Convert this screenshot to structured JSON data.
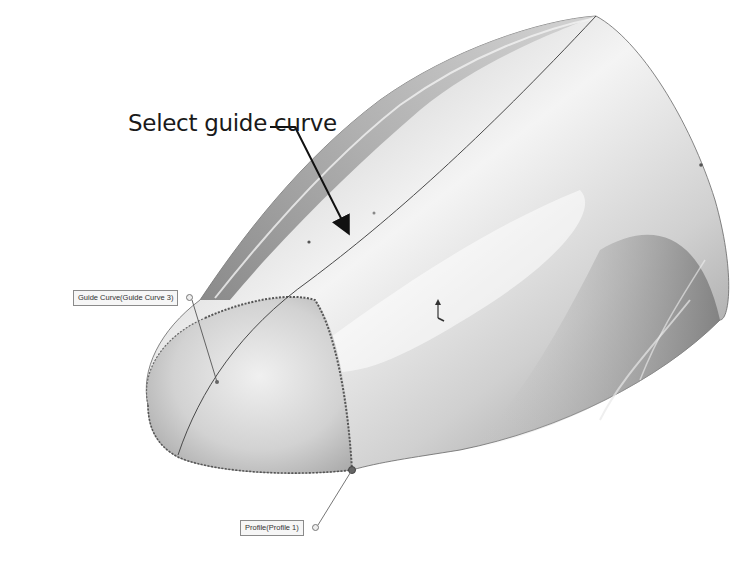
{
  "callout": {
    "text": "Select guide curve"
  },
  "tags": {
    "guide_curve": "Guide Curve(Guide Curve 3)",
    "profile": "Profile(Profile 1)"
  },
  "colors": {
    "background": "#ffffff",
    "body_light": "#e6e6e6",
    "body_mid": "#bdbdbd",
    "body_dark": "#7a7a7a",
    "edge_dashed": "#555555",
    "arrow": "#111111"
  },
  "icons": {
    "triad": "coordinate-triad-icon"
  }
}
